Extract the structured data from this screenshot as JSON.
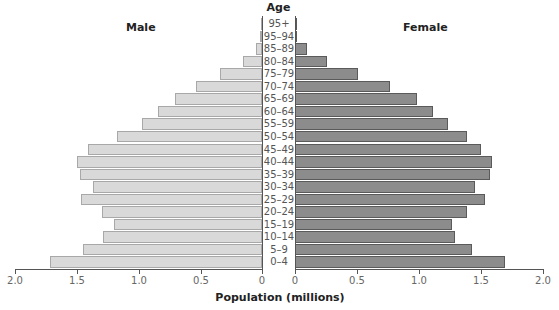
{
  "chart_data": {
    "type": "bar",
    "subtype": "population-pyramid",
    "title": "",
    "center_label": "Age",
    "xlabel": "Population (millions)",
    "ylabel": "Age",
    "xlim": [
      0,
      2.0
    ],
    "x_ticks": [
      "2.0",
      "1.5",
      "1.0",
      "0.5",
      "0",
      "0",
      "0.5",
      "1.0",
      "1.5",
      "2.0"
    ],
    "grid": false,
    "categories": [
      "95+",
      "95–94",
      "85–89",
      "80–84",
      "75–79",
      "70–74",
      "65–69",
      "60–64",
      "55–59",
      "50–54",
      "45–49",
      "40–44",
      "35–39",
      "30–34",
      "25–29",
      "20–24",
      "15–19",
      "10–14",
      "5–9",
      "0–4"
    ],
    "series": [
      {
        "name": "Male",
        "color": "#d9d9d9",
        "values": [
          0.01,
          0.02,
          0.05,
          0.15,
          0.34,
          0.53,
          0.7,
          0.84,
          0.97,
          1.17,
          1.4,
          1.49,
          1.47,
          1.36,
          1.46,
          1.29,
          1.19,
          1.28,
          1.44,
          1.71
        ]
      },
      {
        "name": "Female",
        "color": "#8c8c8c",
        "values": [
          0.01,
          0.02,
          0.1,
          0.26,
          0.51,
          0.77,
          0.98,
          1.11,
          1.23,
          1.39,
          1.5,
          1.59,
          1.57,
          1.45,
          1.53,
          1.39,
          1.27,
          1.29,
          1.43,
          1.69
        ]
      }
    ]
  },
  "labels": {
    "age": "Age",
    "male": "Male",
    "female": "Female",
    "xlabel": "Population (millions)"
  }
}
